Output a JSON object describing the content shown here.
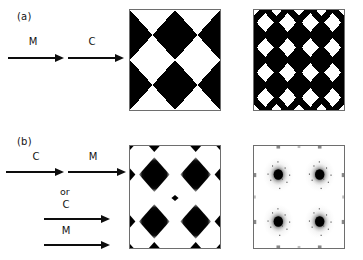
{
  "figure": {
    "background_color": "#ffffff",
    "ink_color": "#0d0d0d",
    "frame_color": "#6e6e6e",
    "width": 363,
    "height": 260
  },
  "panels": [
    {
      "id": "a",
      "label": "(a)",
      "arrow_sequence": [
        {
          "label": "M",
          "name": "arrow-m-1"
        },
        {
          "label": "C",
          "name": "arrow-c-1"
        }
      ],
      "or_label": null,
      "images": [
        {
          "name": "pattern-coarse-checker",
          "kind": "diagonal-checkerboard",
          "tiles": 2,
          "fill": "#000000",
          "background": "#ffffff",
          "edge_markers": false
        },
        {
          "name": "pattern-fine-checker",
          "kind": "diagonal-checkerboard",
          "tiles": 4,
          "fill": "#000000",
          "background": "#ffffff",
          "edge_markers": false
        }
      ]
    },
    {
      "id": "b",
      "label": "(b)",
      "arrow_sequence": [
        {
          "label": "C",
          "name": "arrow-c-2"
        },
        {
          "label": "M",
          "name": "arrow-m-2"
        }
      ],
      "or_label": "or",
      "alt_arrow_sequence": [
        {
          "label": "C",
          "name": "arrow-c-3"
        },
        {
          "label": "M",
          "name": "arrow-m-3"
        }
      ],
      "images": [
        {
          "name": "pattern-sharp-diamonds",
          "kind": "diamond-spots",
          "spots": 2,
          "fill": "#000000",
          "background": "#ffffff",
          "edge_markers": true,
          "diffuse": false
        },
        {
          "name": "pattern-diffuse-spots",
          "kind": "diamond-spots",
          "spots": 2,
          "fill": "#000000",
          "background": "#ffffff",
          "edge_markers": true,
          "diffuse": true
        }
      ]
    }
  ]
}
